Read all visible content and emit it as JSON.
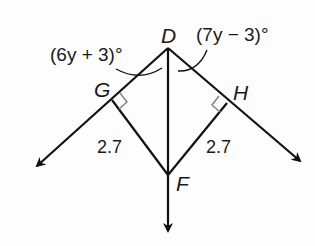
{
  "diagram": {
    "type": "geometry",
    "points": {
      "D": {
        "label": "D",
        "x": 168,
        "y": 48
      },
      "G": {
        "label": "G",
        "x": 112,
        "y": 100
      },
      "H": {
        "label": "H",
        "x": 227,
        "y": 103
      },
      "F": {
        "label": "F",
        "x": 168,
        "y": 175
      }
    },
    "angles": {
      "left": {
        "label": "(6y + 3)°"
      },
      "right": {
        "label": "(7y − 3)°"
      }
    },
    "segments": {
      "GF": {
        "label": "2.7"
      },
      "HF": {
        "label": "2.7"
      }
    },
    "rays": [
      "DG (left, down)",
      "DH (right, down)",
      "DF (down)"
    ],
    "right_angles": [
      "G",
      "H"
    ],
    "colors": {
      "line": "#111111",
      "right_angle_mark": "#888888"
    }
  }
}
